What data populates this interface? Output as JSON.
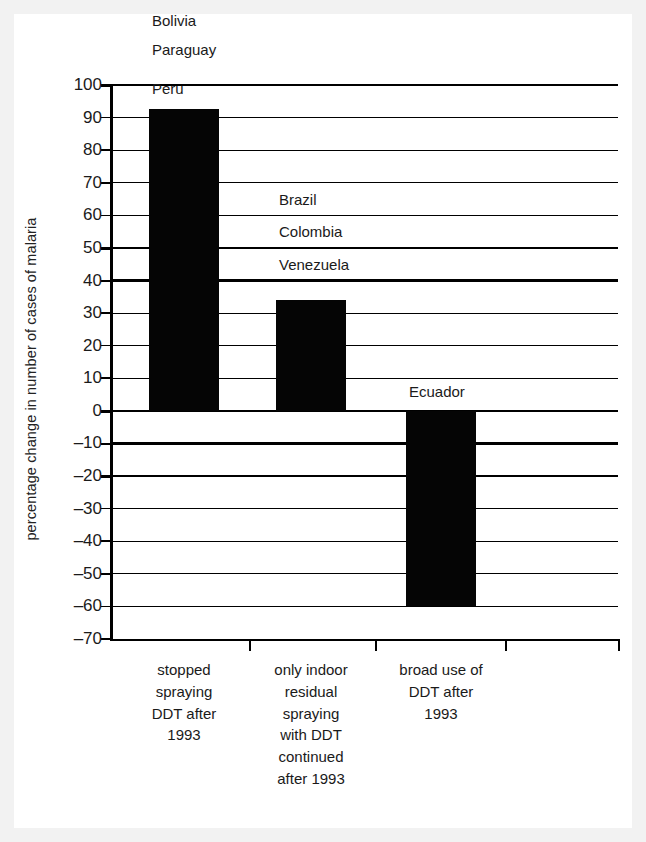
{
  "chart_data": {
    "type": "bar",
    "title": "",
    "xlabel": "",
    "ylabel": "percentage change in number of cases of malaria",
    "ylim": [
      -70,
      100
    ],
    "ytick_step": 10,
    "grid": true,
    "legend": "none",
    "categories": [
      "stopped spraying DDT after 1993",
      "only indoor residual spraying with DDT continued after 1993",
      "broad use of DDT after 1993"
    ],
    "values": [
      92.5,
      34,
      -60
    ],
    "annotations": [
      {
        "text": "Bolivia",
        "value": 117,
        "category_index": 0
      },
      {
        "text": "Paraguay",
        "value": 108,
        "category_index": 0
      },
      {
        "text": "Peru",
        "value": 96,
        "category_index": 0
      },
      {
        "text": "Brazil",
        "value": 62,
        "category_index": 1
      },
      {
        "text": "Colombia",
        "value": 52,
        "category_index": 1
      },
      {
        "text": "Venezuela",
        "value": 42,
        "category_index": 1
      },
      {
        "text": "Ecuador",
        "value": 3,
        "category_index": 2
      }
    ]
  },
  "axis": {
    "y_title": "percentage change in number of cases of malaria",
    "y_ticks": [
      {
        "label": "100",
        "value": 100,
        "emphasis": true
      },
      {
        "label": "90",
        "value": 90,
        "emphasis": false
      },
      {
        "label": "80",
        "value": 80,
        "emphasis": false
      },
      {
        "label": "70",
        "value": 70,
        "emphasis": false
      },
      {
        "label": "60",
        "value": 60,
        "emphasis": false
      },
      {
        "label": "50",
        "value": 50,
        "emphasis": true
      },
      {
        "label": "40",
        "value": 40,
        "emphasis": true
      },
      {
        "label": "30",
        "value": 30,
        "emphasis": false
      },
      {
        "label": "20",
        "value": 20,
        "emphasis": false
      },
      {
        "label": "10",
        "value": 10,
        "emphasis": false
      },
      {
        "label": "0",
        "value": 0,
        "emphasis": true
      },
      {
        "label": "–10",
        "value": -10,
        "emphasis": true
      },
      {
        "label": "–20",
        "value": -20,
        "emphasis": true
      },
      {
        "label": "–30",
        "value": -30,
        "emphasis": false
      },
      {
        "label": "–40",
        "value": -40,
        "emphasis": false
      },
      {
        "label": "–50",
        "value": -50,
        "emphasis": false
      },
      {
        "label": "–60",
        "value": -60,
        "emphasis": false
      },
      {
        "label": "–70",
        "value": -70,
        "emphasis": false
      }
    ]
  },
  "bars": [
    {
      "name": "bar-stopped-spraying",
      "value": 92.5,
      "color": "#050505"
    },
    {
      "name": "bar-indoor-residual",
      "value": 34,
      "color": "#050505"
    },
    {
      "name": "bar-broad-use",
      "value": -60,
      "color": "#050505"
    }
  ],
  "country_labels": [
    {
      "text": "Bolivia"
    },
    {
      "text": "Paraguay"
    },
    {
      "text": "Peru"
    },
    {
      "text": "Brazil"
    },
    {
      "text": "Colombia"
    },
    {
      "text": "Venezuela"
    },
    {
      "text": "Ecuador"
    }
  ],
  "categories": [
    {
      "lines": [
        "stopped",
        "spraying",
        "DDT after",
        "1993"
      ]
    },
    {
      "lines": [
        "only indoor",
        "residual",
        "spraying",
        "with DDT",
        "continued",
        "after 1993"
      ]
    },
    {
      "lines": [
        "broad use of",
        "DDT after",
        "1993"
      ]
    }
  ],
  "colors": {
    "page_background": "#f2f2f2",
    "figure_background": "#ffffff",
    "bar": "#050505",
    "axis": "#000000",
    "text": "#1a1a1a"
  }
}
